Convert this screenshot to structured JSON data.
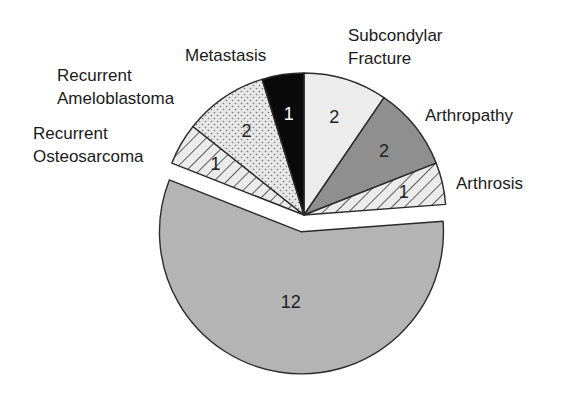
{
  "chart_data": {
    "type": "pie",
    "title": "",
    "total": 21,
    "exploded": [
      "(unlabeled main group)"
    ],
    "slices": [
      {
        "label": "Subcondylar Fracture",
        "label_lines": [
          "Subcondylar",
          "Fracture"
        ],
        "value": 2,
        "fill": "#ececec",
        "pattern": "solid-light",
        "label_x": 348,
        "label_y": 24,
        "value_color": "#222222"
      },
      {
        "label": "Arthropathy",
        "label_lines": [
          "Arthropathy"
        ],
        "value": 2,
        "fill": "#8f8f8f",
        "pattern": "solid-dark",
        "label_x": 425,
        "label_y": 103,
        "value_color": "#222222"
      },
      {
        "label": "Arthrosis",
        "label_lines": [
          "Arthrosis"
        ],
        "value": 1,
        "fill": "#e6e6e6",
        "pattern": "hatch",
        "label_x": 456,
        "label_y": 172,
        "value_color": "#222222"
      },
      {
        "label": "",
        "label_lines": [],
        "value": 12,
        "fill": "#b4b4b4",
        "pattern": "solid-mid",
        "exploded": true,
        "value_color": "#222222"
      },
      {
        "label": "Recurrent Osteosarcoma",
        "label_lines": [
          "Recurrent",
          "Osteosarcoma"
        ],
        "value": 1,
        "fill": "#e6e6e6",
        "pattern": "hatch",
        "label_x": 33,
        "label_y": 122,
        "value_color": "#222222"
      },
      {
        "label": "Recurrent Ameloblastoma",
        "label_lines": [
          "Recurrent",
          "Ameloblastoma"
        ],
        "value": 2,
        "fill": "#e2e2e2",
        "pattern": "dots",
        "label_x": 57,
        "label_y": 64,
        "value_color": "#222222"
      },
      {
        "label": "Metastasis",
        "label_lines": [
          "Metastasis"
        ],
        "value": 1,
        "fill": "#0a0a0a",
        "pattern": "solid-black",
        "label_x": 185,
        "label_y": 44,
        "value_color": "#ffffff"
      }
    ],
    "start_angle_deg": 90,
    "direction": "clockwise",
    "center": [
      304,
      215
    ],
    "radius": 142,
    "explode_offset": 17,
    "legend": "none (direct labels)",
    "grid": false
  },
  "labels": {
    "subcondylar_1": "Subcondylar",
    "subcondylar_2": "Fracture",
    "arthropathy": "Arthropathy",
    "arthrosis": "Arthrosis",
    "osteo_1": "Recurrent",
    "osteo_2": "Osteosarcoma",
    "amelo_1": "Recurrent",
    "amelo_2": "Ameloblastoma",
    "metastasis": "Metastasis"
  }
}
